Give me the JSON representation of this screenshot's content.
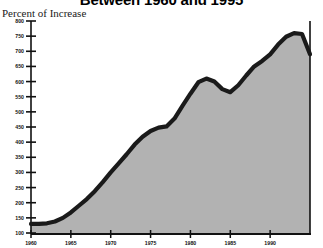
{
  "header": {
    "title": "Between 1960 and 1995",
    "subtitle": "Percent of Increase"
  },
  "colors": {
    "line": "#1a1a1a",
    "fill": "#b2b2b2",
    "axis": "#111111",
    "background": "#ffffff"
  },
  "chart_data": {
    "type": "area",
    "title": "Between 1960 and 1995",
    "subtitle": "Percent of Increase",
    "xlabel": "",
    "ylabel": "Percent of Increase",
    "xlim": [
      1960,
      1995
    ],
    "ylim": [
      100,
      800
    ],
    "grid": false,
    "legend": "none",
    "ytick_labels": [
      "800",
      "750",
      "700",
      "650",
      "600",
      "550",
      "500",
      "450",
      "400",
      "350",
      "300",
      "250",
      "200",
      "150",
      "100"
    ],
    "ytick_values": [
      800,
      750,
      700,
      650,
      600,
      550,
      500,
      450,
      400,
      350,
      300,
      250,
      200,
      150,
      100
    ],
    "xtick_labels": [
      "1960",
      "1965",
      "1970",
      "1975",
      "1980",
      "1985",
      "1990"
    ],
    "xtick_values": [
      1960,
      1965,
      1970,
      1975,
      1980,
      1985,
      1990
    ],
    "x": [
      1960,
      1961,
      1962,
      1963,
      1964,
      1965,
      1966,
      1967,
      1968,
      1969,
      1970,
      1971,
      1972,
      1973,
      1974,
      1975,
      1976,
      1977,
      1978,
      1979,
      1980,
      1981,
      1982,
      1983,
      1984,
      1985,
      1986,
      1987,
      1988,
      1989,
      1990,
      1991,
      1992,
      1993,
      1994,
      1995
    ],
    "values": [
      130,
      130,
      132,
      138,
      150,
      168,
      190,
      212,
      238,
      268,
      300,
      330,
      360,
      392,
      418,
      437,
      448,
      452,
      478,
      520,
      560,
      598,
      610,
      600,
      575,
      565,
      588,
      620,
      650,
      668,
      690,
      722,
      748,
      760,
      757,
      690
    ],
    "series": [
      {
        "name": "Percent of Increase",
        "values": [
          130,
          130,
          132,
          138,
          150,
          168,
          190,
          212,
          238,
          268,
          300,
          330,
          360,
          392,
          418,
          437,
          448,
          452,
          478,
          520,
          560,
          598,
          610,
          600,
          575,
          565,
          588,
          620,
          650,
          668,
          690,
          722,
          748,
          760,
          757,
          690
        ]
      }
    ]
  }
}
